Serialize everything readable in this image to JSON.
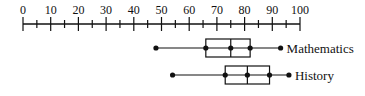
{
  "chart_data": {
    "type": "boxplot",
    "title": "",
    "xlabel": "",
    "ylabel": "",
    "xlim": [
      0,
      100
    ],
    "ticks": {
      "major": [
        0,
        10,
        20,
        30,
        40,
        50,
        60,
        70,
        80,
        90,
        100
      ],
      "minor_step": 5
    },
    "tick_labels": [
      "0",
      "10",
      "20",
      "30",
      "40",
      "50",
      "60",
      "70",
      "80",
      "90",
      "100"
    ],
    "grid": false,
    "legend": "labels placed to the right of each box",
    "series": [
      {
        "name": "Mathematics",
        "min": 48,
        "q1": 66,
        "median": 75,
        "q3": 82,
        "max": 93
      },
      {
        "name": "History",
        "min": 54,
        "q1": 73,
        "median": 81,
        "q3": 89,
        "max": 96
      }
    ]
  },
  "colors": {
    "ink": "#111111",
    "background": "#ffffff"
  }
}
